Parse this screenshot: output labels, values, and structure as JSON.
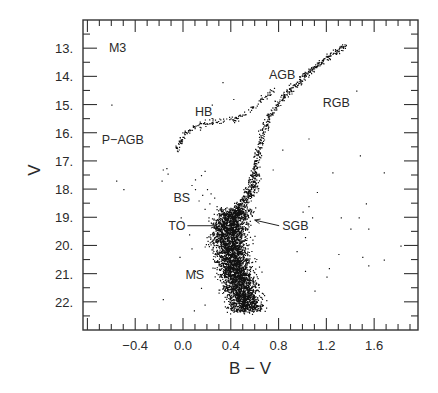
{
  "chart_data": {
    "type": "scatter",
    "title": "M3",
    "xlabel": "B − V",
    "ylabel": "V",
    "xlim": [
      -0.837,
      1.967
    ],
    "ylim": [
      23.0,
      12.0
    ],
    "y_inverted": true,
    "grid": false,
    "legend": null,
    "x_ticks": [
      {
        "value": -0.4,
        "label": "−0.4"
      },
      {
        "value": 0.0,
        "label": "0.0"
      },
      {
        "value": 0.4,
        "label": "0.4"
      },
      {
        "value": 0.8,
        "label": "0.8"
      },
      {
        "value": 1.2,
        "label": "1.2"
      },
      {
        "value": 1.6,
        "label": "1.6"
      }
    ],
    "x_minor_step": 0.1,
    "y_ticks": [
      {
        "value": 13,
        "label": "13."
      },
      {
        "value": 14,
        "label": "14."
      },
      {
        "value": 15,
        "label": "15."
      },
      {
        "value": 16,
        "label": "16."
      },
      {
        "value": 17,
        "label": "17."
      },
      {
        "value": 18,
        "label": "18."
      },
      {
        "value": 19,
        "label": "19."
      },
      {
        "value": 20,
        "label": "20."
      },
      {
        "value": 21,
        "label": "21."
      },
      {
        "value": 22,
        "label": "22."
      }
    ],
    "y_minor_step": 0.5,
    "annotations": [
      {
        "text": "M3",
        "bv": -0.62,
        "v": 13.0
      },
      {
        "text": "AGB",
        "bv": 0.72,
        "v": 13.95
      },
      {
        "text": "RGB",
        "bv": 1.17,
        "v": 14.95
      },
      {
        "text": "HB",
        "bv": 0.1,
        "v": 15.25
      },
      {
        "text": "P−AGB",
        "bv": -0.68,
        "v": 16.25
      },
      {
        "text": "BS",
        "bv": -0.08,
        "v": 18.3
      },
      {
        "text": "TO",
        "bv": 0.02,
        "v": 19.3,
        "arrow_to": {
          "bv": 0.28,
          "v": 19.3
        }
      },
      {
        "text": "SGB",
        "bv": 0.83,
        "v": 19.3,
        "arrow_to": {
          "bv": 0.6,
          "v": 19.1
        }
      },
      {
        "text": "MS",
        "bv": 0.02,
        "v": 21.05
      }
    ],
    "series": [
      {
        "name": "Main sequence + turnoff (dense core)",
        "ridge": [
          [
            0.52,
            22.3
          ],
          [
            0.48,
            21.5
          ],
          [
            0.42,
            20.6
          ],
          [
            0.38,
            19.8
          ],
          [
            0.39,
            19.2
          ],
          [
            0.45,
            18.7
          ]
        ],
        "width_bv": 0.14,
        "count": 3800
      },
      {
        "name": "Subgiant branch",
        "ridge": [
          [
            0.45,
            18.7
          ],
          [
            0.53,
            18.3
          ],
          [
            0.58,
            17.9
          ],
          [
            0.6,
            17.4
          ]
        ],
        "width_bv": 0.05,
        "count": 260
      },
      {
        "name": "Red giant branch (RGB)",
        "ridge": [
          [
            0.6,
            17.4
          ],
          [
            0.63,
            16.6
          ],
          [
            0.66,
            16.0
          ],
          [
            0.72,
            15.4
          ],
          [
            0.82,
            14.8
          ],
          [
            0.98,
            14.1
          ],
          [
            1.15,
            13.5
          ],
          [
            1.35,
            12.9
          ]
        ],
        "width_bv": 0.03,
        "count": 420
      },
      {
        "name": "Asymptotic giant branch (AGB)",
        "ridge": [
          [
            0.5,
            15.4
          ],
          [
            0.58,
            15.1
          ],
          [
            0.66,
            14.8
          ],
          [
            0.76,
            14.4
          ]
        ],
        "width_bv": 0.03,
        "count": 45
      },
      {
        "name": "Horizontal branch (HB)",
        "ridge": [
          [
            -0.05,
            16.55
          ],
          [
            0.0,
            16.1
          ],
          [
            0.05,
            15.85
          ],
          [
            0.15,
            15.7
          ],
          [
            0.25,
            15.6
          ],
          [
            0.4,
            15.55
          ],
          [
            0.48,
            15.45
          ]
        ],
        "width_bv": 0.025,
        "count": 120
      },
      {
        "name": "Blue stragglers (BS) & field",
        "points": [
          [
            -0.14,
            17.25
          ],
          [
            -0.13,
            17.45
          ],
          [
            -0.17,
            17.3
          ],
          [
            -0.18,
            17.7
          ],
          [
            0.1,
            17.65
          ],
          [
            0.15,
            17.5
          ],
          [
            0.18,
            17.35
          ],
          [
            0.07,
            17.85
          ],
          [
            0.1,
            18.0
          ],
          [
            0.2,
            18.0
          ],
          [
            0.23,
            18.15
          ],
          [
            0.16,
            18.2
          ],
          [
            0.26,
            18.3
          ],
          [
            0.13,
            18.4
          ],
          [
            0.22,
            18.5
          ],
          [
            0.28,
            18.6
          ],
          [
            0.18,
            18.7
          ],
          [
            0.3,
            18.9
          ],
          [
            -0.02,
            19.0
          ],
          [
            0.05,
            19.6
          ],
          [
            0.07,
            20.1
          ],
          [
            -0.03,
            20.4
          ],
          [
            0.1,
            20.9
          ],
          [
            0.15,
            21.5
          ],
          [
            0.18,
            22.1
          ],
          [
            0.09,
            22.3
          ],
          [
            -0.17,
            21.9
          ],
          [
            -0.6,
            15.0
          ],
          [
            -0.56,
            17.7
          ],
          [
            -0.5,
            18.0
          ]
        ]
      },
      {
        "name": "Field / red scatter",
        "points": [
          [
            1.45,
            14.5
          ],
          [
            1.05,
            16.2
          ],
          [
            1.48,
            16.8
          ],
          [
            1.25,
            17.4
          ],
          [
            1.68,
            17.4
          ],
          [
            1.12,
            18.1
          ],
          [
            1.05,
            18.6
          ],
          [
            1.08,
            19.0
          ],
          [
            1.32,
            19.0
          ],
          [
            1.47,
            19.0
          ],
          [
            1.53,
            18.5
          ],
          [
            1.4,
            19.4
          ],
          [
            1.55,
            19.4
          ],
          [
            1.82,
            20.0
          ],
          [
            1.5,
            20.4
          ],
          [
            1.55,
            20.7
          ],
          [
            1.68,
            20.5
          ],
          [
            1.3,
            20.3
          ],
          [
            1.22,
            20.8
          ],
          [
            1.2,
            21.1
          ],
          [
            1.1,
            21.6
          ],
          [
            1.02,
            20.9
          ],
          [
            0.95,
            20.2
          ],
          [
            1.02,
            19.7
          ],
          [
            1.0,
            18.8
          ],
          [
            0.75,
            17.3
          ],
          [
            0.83,
            16.6
          ],
          [
            0.42,
            14.8
          ],
          [
            0.24,
            15.0
          ],
          [
            0.33,
            14.2
          ]
        ]
      }
    ]
  }
}
